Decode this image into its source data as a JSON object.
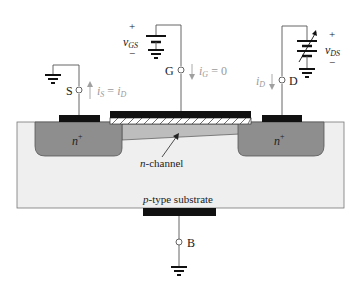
{
  "diagram": {
    "terminals": {
      "source": "S",
      "gate": "G",
      "drain": "D",
      "body": "B"
    },
    "regions": {
      "source_region": "n",
      "source_region_sup": "+",
      "drain_region": "n",
      "drain_region_sup": "+",
      "channel": "n",
      "channel_suffix": "-channel",
      "substrate": "p",
      "substrate_suffix": "-type substrate"
    },
    "sources": {
      "gate_source": {
        "name": "v",
        "sub": "GS",
        "plus": "+",
        "minus": "−"
      },
      "drain_source": {
        "name": "v",
        "sub": "DS",
        "plus": "+",
        "minus": "−"
      }
    },
    "currents": {
      "source_current": {
        "lhs": "i",
        "lhs_sub": "S",
        "eq": " = ",
        "rhs": "i",
        "rhs_sub": "D"
      },
      "gate_current": {
        "lhs": "i",
        "lhs_sub": "G",
        "eq": " = ",
        "rhs": "0"
      },
      "drain_current": {
        "lhs": "i",
        "lhs_sub": "D"
      }
    },
    "colors": {
      "substrate": "#efefef",
      "n_plus": "#8e8e8e",
      "channel": "#bdbdbd",
      "metal": "#111111",
      "wire": "#555555",
      "current_arrow": "#a0a0a0"
    }
  }
}
